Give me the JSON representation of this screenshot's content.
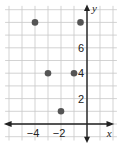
{
  "chart_data": {
    "type": "scatter",
    "title": "",
    "xlabel": "x",
    "ylabel": "y",
    "xlim": [
      -6,
      1.5
    ],
    "ylim": [
      -1,
      9
    ],
    "grid": true,
    "x_tick_labels": [
      "−4",
      "−2"
    ],
    "x_ticks": [
      -4,
      -2
    ],
    "y_tick_labels": [
      "2",
      "4",
      "6"
    ],
    "y_ticks": [
      2,
      4,
      6
    ],
    "points": [
      {
        "x": -4,
        "y": 8
      },
      {
        "x": -0.5,
        "y": 8,
        "estimated": true
      },
      {
        "x": -3,
        "y": 4
      },
      {
        "x": -1,
        "y": 4
      },
      {
        "x": -2,
        "y": 1
      }
    ],
    "point_color": "#555555",
    "axis_color": "#222222",
    "grid_color": "#c8c8c8"
  }
}
